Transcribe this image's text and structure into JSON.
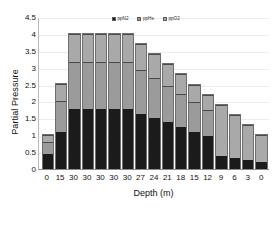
{
  "chart_data": {
    "type": "bar",
    "stacked": true,
    "title": "",
    "xlabel": "Depth (m)",
    "ylabel": "Partial Pressure",
    "categories": [
      "0",
      "15",
      "30",
      "30",
      "30",
      "30",
      "30",
      "27",
      "24",
      "21",
      "18",
      "15",
      "12",
      "9",
      "6",
      "3",
      "0"
    ],
    "ylim": [
      0,
      4.5
    ],
    "yticks": [
      "0",
      "0.5",
      "1",
      "1.5",
      "2",
      "2.5",
      "3",
      "3.5",
      "4",
      "4.5"
    ],
    "ytick_values": [
      0,
      0.5,
      1,
      1.5,
      2,
      2.5,
      3,
      3.5,
      4,
      4.5
    ],
    "grid": true,
    "legend_position": "top-center",
    "series": [
      {
        "name": "ppN2",
        "color": "#1b1b1b",
        "values": [
          0.45,
          1.11,
          1.79,
          1.79,
          1.79,
          1.79,
          1.79,
          1.64,
          1.51,
          1.38,
          1.25,
          1.11,
          0.98,
          0.39,
          0.33,
          0.26,
          0.2
        ]
      },
      {
        "name": "ppHe",
        "color": "#9b9b9b",
        "values": [
          0.34,
          0.89,
          1.38,
          1.38,
          1.38,
          1.38,
          1.38,
          1.29,
          1.19,
          1.07,
          0.97,
          0.86,
          0.76,
          0.0,
          0.0,
          0.0,
          0.0
        ]
      },
      {
        "name": "ppO2",
        "color": "#a9a9a9",
        "values": [
          0.21,
          0.52,
          0.83,
          0.83,
          0.83,
          0.83,
          0.83,
          0.78,
          0.71,
          0.66,
          0.58,
          0.53,
          0.46,
          1.51,
          1.27,
          1.04,
          0.8
        ]
      }
    ],
    "totals": [
      1.0,
      2.52,
      4.0,
      4.0,
      4.0,
      4.0,
      4.0,
      3.71,
      3.41,
      3.11,
      2.8,
      2.5,
      2.2,
      1.9,
      1.6,
      1.3,
      1.0
    ]
  },
  "legend": {
    "items": [
      {
        "label": "ppN2"
      },
      {
        "label": "ppHe"
      },
      {
        "label": "ppO2"
      }
    ]
  }
}
